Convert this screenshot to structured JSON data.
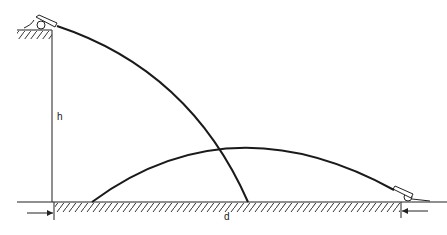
{
  "diagram": {
    "labels": {
      "height": "h",
      "distance": "d"
    },
    "elements": {
      "left_cannon": "cannon on cliff top",
      "right_cannon": "cannon on ground",
      "cliff": "vertical cliff of height h",
      "ground": "hatched ground",
      "trajectory_from_cliff": "descending parabola from cliff cannon",
      "trajectory_from_ground": "arching parabola from ground cannon"
    },
    "colors": {
      "line": "#1a1a1a",
      "hatch": "#333333",
      "background": "#ffffff"
    }
  }
}
